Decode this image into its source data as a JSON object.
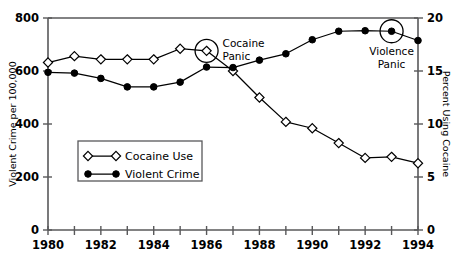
{
  "chart_data": {
    "type": "line",
    "title": "",
    "xlabel": "",
    "ylabel": "Violent Crime per 100,000",
    "y2label": "Percent Using Cocaine",
    "x": [
      1980,
      1981,
      1982,
      1983,
      1984,
      1985,
      1986,
      1987,
      1988,
      1989,
      1990,
      1991,
      1992,
      1993,
      1994
    ],
    "xlim": [
      1980,
      1994
    ],
    "xticks": [
      1980,
      1981,
      1982,
      1983,
      1984,
      1985,
      1986,
      1987,
      1988,
      1989,
      1990,
      1991,
      1992,
      1993,
      1994
    ],
    "xticklabels": [
      "1980",
      "1982",
      "1984",
      "1986",
      "1988",
      "1990",
      "1992",
      "1994"
    ],
    "xticklabel_years": [
      1980,
      1982,
      1984,
      1986,
      1988,
      1990,
      1992,
      1994
    ],
    "ylim": [
      0,
      800
    ],
    "yticks": [
      0,
      200,
      400,
      600,
      800
    ],
    "yticklabels": [
      "0",
      "200",
      "400",
      "600",
      "800"
    ],
    "y2lim": [
      0,
      20
    ],
    "y2ticks": [
      0,
      5,
      10,
      15,
      20
    ],
    "y2ticklabels": [
      "0",
      "5",
      "10",
      "15",
      "20"
    ],
    "grid": false,
    "legend_position": "center-left",
    "series": [
      {
        "name": "Cocaine Use",
        "axis": "right",
        "units": "percent",
        "marker": "open-diamond",
        "values": [
          15.8,
          16.4,
          16.1,
          16.1,
          16.1,
          17.1,
          16.9,
          15.0,
          12.5,
          10.2,
          9.6,
          8.2,
          6.8,
          6.9,
          6.3
        ]
      },
      {
        "name": "Violent Crime",
        "axis": "left",
        "units": "per 100,000",
        "marker": "solid-circle",
        "values": [
          595,
          592,
          572,
          540,
          540,
          558,
          615,
          613,
          641,
          665,
          718,
          750,
          752,
          750,
          715
        ]
      }
    ],
    "annotations": [
      {
        "label": "Cocaine Panic",
        "line1": "Cocaine",
        "line2": "Panic",
        "target_series": "Cocaine Use",
        "target_year": 1986,
        "target_value": 16.9
      },
      {
        "label": "Violence Panic",
        "line1": "Violence",
        "line2": "Panic",
        "target_series": "Violent Crime",
        "target_year": 1993,
        "target_value": 750
      }
    ]
  },
  "legend": {
    "items": [
      {
        "label": "Cocaine Use",
        "marker": "open-diamond"
      },
      {
        "label": "Violent Crime",
        "marker": "solid-circle"
      }
    ]
  },
  "colors": {
    "ink": "#000000",
    "axis": "#58585a",
    "background": "#ffffff"
  }
}
